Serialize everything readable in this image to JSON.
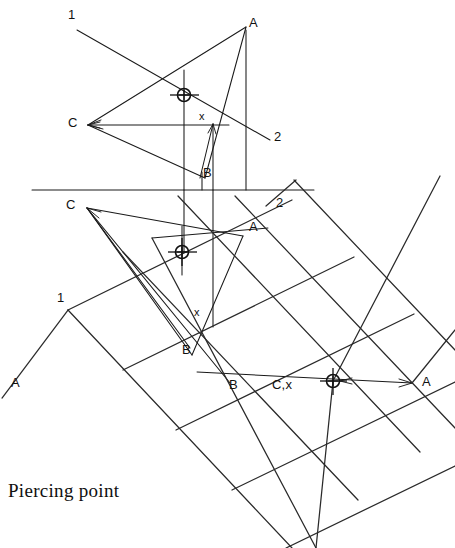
{
  "figure": {
    "caption": "Piercing point",
    "title": "Piercing point",
    "ink_color": "#1a1a1a",
    "background_color": "#ffffff"
  },
  "labels": {
    "top_view": [
      {
        "id": "top-line-1",
        "text": "1",
        "x": 68,
        "y": 8
      },
      {
        "id": "top-vertex-a",
        "text": "A",
        "x": 249,
        "y": 16
      },
      {
        "id": "top-vertex-c",
        "text": "C",
        "x": 68,
        "y": 116
      },
      {
        "id": "top-point-x",
        "text": "x",
        "x": 199,
        "y": 111
      },
      {
        "id": "top-line-2",
        "text": "2",
        "x": 274,
        "y": 130
      },
      {
        "id": "top-vertex-b",
        "text": "B",
        "x": 203,
        "y": 166
      }
    ],
    "front_view": [
      {
        "id": "front-vertex-c",
        "text": "C",
        "x": 66,
        "y": 198
      },
      {
        "id": "front-line-2",
        "text": "2",
        "x": 276,
        "y": 196
      },
      {
        "id": "front-vertex-a",
        "text": "A",
        "x": 249,
        "y": 220
      },
      {
        "id": "front-line-1",
        "text": "1",
        "x": 57,
        "y": 291
      },
      {
        "id": "front-point-x",
        "text": "x",
        "x": 194,
        "y": 307
      },
      {
        "id": "front-corner-a",
        "text": "A",
        "x": 11,
        "y": 376
      },
      {
        "id": "front-vertex-b1",
        "text": "B",
        "x": 182,
        "y": 343
      },
      {
        "id": "front-vertex-b2",
        "text": "B",
        "x": 229,
        "y": 378
      },
      {
        "id": "front-point-cx",
        "text": "C,x",
        "x": 272,
        "y": 378
      },
      {
        "id": "front-right-a",
        "text": "A",
        "x": 422,
        "y": 375
      }
    ]
  },
  "markers": [
    {
      "id": "piercing-marker-top",
      "cx": 184,
      "cy": 95,
      "r": 6.5
    },
    {
      "id": "piercing-marker-front",
      "cx": 182,
      "cy": 252,
      "r": 6.5
    },
    {
      "id": "piercing-marker-right",
      "cx": 333,
      "cy": 381,
      "r": 6.5
    }
  ],
  "geometry": {
    "ground_line": {
      "x1": 32,
      "y1": 190,
      "x2": 314,
      "y2": 190
    },
    "top_triangle": {
      "a": [
        246,
        27
      ],
      "b": [
        205,
        178
      ],
      "c": [
        88,
        125
      ]
    },
    "front_triangle": {
      "a": [
        243,
        236
      ],
      "b": [
        192,
        355
      ],
      "c": [
        87,
        208
      ]
    }
  }
}
